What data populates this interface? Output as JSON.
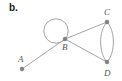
{
  "figure": {
    "label": "b.",
    "type": "multigraph-diagram"
  },
  "graph_data": {
    "type": "graph",
    "vertices": [
      {
        "id": "A",
        "label": "A",
        "x": 22,
        "y": 69,
        "label_x": 18,
        "label_y": 62
      },
      {
        "id": "B",
        "label": "B",
        "x": 65,
        "y": 39,
        "label_x": 62,
        "label_y": 50
      },
      {
        "id": "C",
        "label": "C",
        "x": 107,
        "y": 22,
        "label_x": 104,
        "label_y": 15
      },
      {
        "id": "D",
        "label": "D",
        "x": 107,
        "y": 62,
        "label_x": 104,
        "label_y": 76
      }
    ],
    "edges": [
      {
        "from": "A",
        "to": "B",
        "kind": "straight"
      },
      {
        "from": "B",
        "to": "C",
        "kind": "straight"
      },
      {
        "from": "B",
        "to": "D",
        "kind": "straight"
      },
      {
        "from": "C",
        "to": "D",
        "kind": "parallel-left"
      },
      {
        "from": "C",
        "to": "D",
        "kind": "parallel-right"
      },
      {
        "from": "B",
        "to": "B",
        "kind": "self-loop"
      }
    ],
    "self_loop": {
      "vertex": "B",
      "cx": 56,
      "cy": 31,
      "r": 12
    },
    "colors": {
      "edge": "#9a9a9a",
      "vertex": "#808080",
      "label": "#555555",
      "figure_label": "#1a1a1a",
      "background": "#ffffff"
    }
  }
}
